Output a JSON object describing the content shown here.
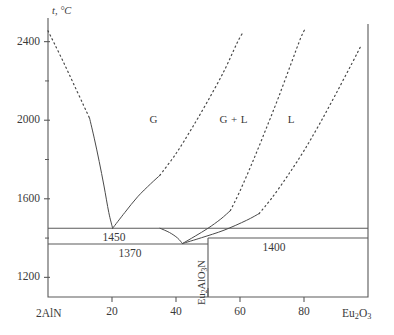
{
  "chart_data": {
    "type": "line",
    "title": "",
    "subtitle": "",
    "xlabel": "",
    "ylabel": "t, °C",
    "y_axis_symbol": "t",
    "y_axis_unit": "°C",
    "xlim": [
      0,
      100
    ],
    "ylim": [
      1100,
      2500
    ],
    "grid": false,
    "legend_position": "none",
    "x_left_endmember": "2AlN",
    "x_right_endmember": "Eu2O3",
    "x_right_endmember_parts": [
      "Eu",
      "2",
      "O",
      "3"
    ],
    "y_ticks_major": [
      1200,
      1600,
      2000,
      2400
    ],
    "y_tick_labels": [
      "1200",
      "1600",
      "2000",
      "2400"
    ],
    "y_ticks_minor": [
      1400,
      1800,
      2200
    ],
    "x_ticks_major": [
      20,
      40,
      60,
      80
    ],
    "x_tick_labels": [
      "20",
      "40",
      "60",
      "80"
    ],
    "x_ticks_extra": [
      50
    ],
    "regions": [
      {
        "name": "G",
        "label": "G",
        "x": 33,
        "y": 2000
      },
      {
        "name": "G+L",
        "label": "G + L",
        "x": 58,
        "y": 2000
      },
      {
        "name": "L",
        "label": "L",
        "x": 76,
        "y": 2000
      }
    ],
    "isotherms": [
      {
        "name": "eutectic-1450",
        "label": "1450",
        "temperature": 1450,
        "x_from": 0,
        "x_to": 100,
        "label_x": 17
      },
      {
        "name": "eutectoid-1370",
        "label": "1370",
        "temperature": 1370,
        "x_from": 0,
        "x_to": 50,
        "label_x": 22
      },
      {
        "name": "eutectic-1400",
        "label": "1400",
        "temperature": 1400,
        "x_from": 50,
        "x_to": 100,
        "label_x": 67
      }
    ],
    "compound": {
      "name": "Eu2AlO3N",
      "label_parts": [
        "Eu",
        "2",
        "AlO",
        "3",
        "N"
      ],
      "composition": 50,
      "line_from_temperature": 1100,
      "line_to_temperature": 1400
    },
    "series": [
      {
        "name": "aln-liquidus-dashed",
        "style": "dashed",
        "points": [
          [
            0,
            2455
          ],
          [
            2,
            2390
          ],
          [
            5,
            2290
          ],
          [
            8,
            2185
          ],
          [
            11,
            2080
          ],
          [
            13,
            2010
          ]
        ]
      },
      {
        "name": "aln-liquidus-solid",
        "style": "solid",
        "points": [
          [
            13,
            2010
          ],
          [
            14.5,
            1905
          ],
          [
            16,
            1790
          ],
          [
            17.5,
            1665
          ],
          [
            19,
            1530
          ],
          [
            20.2,
            1450
          ]
        ]
      },
      {
        "name": "compound-liquidus-left-solid",
        "style": "solid",
        "points": [
          [
            20.2,
            1450
          ],
          [
            24,
            1530
          ],
          [
            28,
            1610
          ],
          [
            32,
            1675
          ],
          [
            35,
            1720
          ]
        ]
      },
      {
        "name": "compound-liquidus-left-dashed",
        "style": "dashed",
        "points": [
          [
            35,
            1720
          ],
          [
            40,
            1830
          ],
          [
            45,
            1960
          ],
          [
            50,
            2100
          ],
          [
            55,
            2250
          ],
          [
            59,
            2390
          ],
          [
            61,
            2450
          ]
        ]
      },
      {
        "name": "solvus-upper-solid",
        "style": "solid",
        "points": [
          [
            35,
            1450
          ],
          [
            38,
            1428
          ],
          [
            40.5,
            1400
          ],
          [
            42,
            1372
          ]
        ]
      },
      {
        "name": "solvus-lower-solid",
        "style": "solid",
        "points": [
          [
            42,
            1372
          ],
          [
            46,
            1410
          ],
          [
            50,
            1450
          ],
          [
            54,
            1497
          ],
          [
            57,
            1540
          ]
        ]
      },
      {
        "name": "compound-liquidus-right-dashed",
        "style": "dashed",
        "points": [
          [
            57,
            1540
          ],
          [
            60,
            1640
          ],
          [
            64,
            1790
          ],
          [
            68,
            1950
          ],
          [
            72,
            2115
          ],
          [
            76,
            2290
          ],
          [
            79,
            2420
          ],
          [
            80.5,
            2470
          ]
        ]
      },
      {
        "name": "eu2o3-liquidus-solid",
        "style": "solid",
        "points": [
          [
            42,
            1372
          ],
          [
            48,
            1402
          ],
          [
            55,
            1440
          ],
          [
            62,
            1490
          ],
          [
            66,
            1525
          ]
        ]
      },
      {
        "name": "eu2o3-liquidus-dashed",
        "style": "dashed",
        "points": [
          [
            66,
            1525
          ],
          [
            70,
            1605
          ],
          [
            75,
            1720
          ],
          [
            80,
            1845
          ],
          [
            85,
            1985
          ],
          [
            90,
            2135
          ],
          [
            95,
            2290
          ],
          [
            98,
            2385
          ]
        ]
      }
    ]
  },
  "axes": {
    "y_axis_label_symbol": "t",
    "y_axis_label_unit": ", °C"
  }
}
